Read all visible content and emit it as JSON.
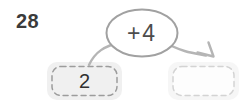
{
  "problem": {
    "number": "28"
  },
  "machine": {
    "operation_label": "+4",
    "input_value": "2",
    "answer_value": ""
  },
  "colors": {
    "text_dark": "#3b3b3b",
    "oval_stroke": "#a1a1a1",
    "arrow": "#b5b5b5",
    "input_box_bg": "#f0f0f0",
    "input_box_dash": "#9c9c9c",
    "answer_box_bg": "#f6f6f6",
    "answer_box_inner_bg": "#fdfdfd",
    "answer_box_dash": "#d3d3d3"
  }
}
